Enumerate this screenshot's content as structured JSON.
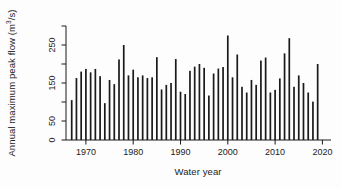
{
  "figure": {
    "background": "#fdfdfd"
  },
  "chart_data": {
    "type": "bar",
    "title": "",
    "xlabel": "Water year",
    "ylabel": {
      "pre": "Annual maximum peak flow (m",
      "sup": "3",
      "post": "/s)"
    },
    "x": [
      1967,
      1968,
      1969,
      1970,
      1971,
      1972,
      1973,
      1974,
      1975,
      1976,
      1977,
      1978,
      1979,
      1980,
      1981,
      1982,
      1983,
      1984,
      1985,
      1986,
      1987,
      1988,
      1989,
      1990,
      1991,
      1992,
      1993,
      1994,
      1995,
      1996,
      1997,
      1998,
      1999,
      2000,
      2001,
      2002,
      2003,
      2004,
      2005,
      2006,
      2007,
      2008,
      2009,
      2010,
      2011,
      2012,
      2013,
      2014,
      2015,
      2016,
      2017,
      2018,
      2019
    ],
    "values": [
      105,
      163,
      180,
      187,
      178,
      187,
      168,
      97,
      158,
      147,
      212,
      250,
      170,
      185,
      165,
      170,
      163,
      165,
      218,
      133,
      145,
      150,
      213,
      127,
      121,
      182,
      193,
      200,
      190,
      117,
      175,
      188,
      192,
      275,
      165,
      225,
      140,
      125,
      158,
      145,
      209,
      217,
      125,
      132,
      162,
      228,
      268,
      140,
      170,
      150,
      125,
      101,
      200
    ],
    "xlim": [
      1965,
      2022
    ],
    "ylim": [
      0,
      300
    ],
    "x_ticks": [
      1970,
      1980,
      1990,
      2000,
      2010,
      2020
    ],
    "y_ticks": [
      0,
      50,
      100,
      150,
      200,
      250,
      300
    ],
    "y_tick_labels": [
      "0",
      "50",
      "",
      "150",
      "",
      "250",
      ""
    ],
    "bar_color": "#1a1a1a",
    "axis_color": "#1a1a1a",
    "text_color": "#222222",
    "grid": false,
    "legend": "none"
  }
}
